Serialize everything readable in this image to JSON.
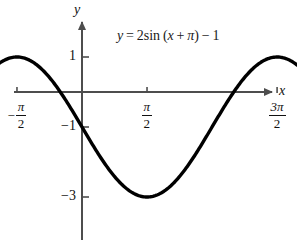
{
  "figure": {
    "background": "#ffffff",
    "curve_color": "#000000",
    "axis_color": "#4d4d4d",
    "text_color": "#111111"
  },
  "annotation": {
    "equation_text": "y = 2 sin (x + π) − 1",
    "lhs": "y",
    "equals": "=",
    "amplitude": "2",
    "function": "sin",
    "open_paren": "(",
    "variable": "x",
    "plus": "+",
    "phase": "π",
    "close_paren": ")",
    "minus": "−",
    "offset": "1"
  },
  "axes": {
    "x_name": "x",
    "y_name": "y",
    "x_ticks": [
      {
        "label": "−π/2",
        "sign": "−",
        "numerator": "π",
        "denominator": "2",
        "value": -1.5707963
      },
      {
        "label": "π/2",
        "sign": "",
        "numerator": "π",
        "denominator": "2",
        "value": 1.5707963
      },
      {
        "label": "3π/2",
        "sign": "",
        "numerator": "3π",
        "denominator": "2",
        "value": 4.712389
      },
      {
        "label": "5π/2",
        "sign": "",
        "numerator": "5π",
        "denominator": "2",
        "value": 7.8539816
      }
    ],
    "y_ticks": [
      {
        "label": "1",
        "value": 1
      },
      {
        "label": "−1",
        "value": -1
      },
      {
        "label": "−3",
        "value": -3
      }
    ]
  },
  "chart_data": {
    "type": "line",
    "xlabel": "x",
    "ylabel": "y",
    "function": "y = 2*sin(x + pi) - 1",
    "amplitude": 2,
    "period": 6.2831853,
    "phase_shift": -3.1415927,
    "vertical_shift": -1,
    "xlim": [
      -2.6179939,
      9.424778
    ],
    "ylim": [
      -3.6,
      1.6
    ],
    "grid": false,
    "legend": null,
    "x_tick_values": [
      -1.5707963,
      1.5707963,
      4.712389,
      7.8539816
    ],
    "x_tick_labels": [
      "−π/2",
      "π/2",
      "3π/2",
      "5π/2"
    ],
    "y_tick_values": [
      1,
      -1,
      -3
    ],
    "y_tick_labels": [
      "1",
      "−1",
      "−3"
    ],
    "maxima": [
      {
        "x": -1.5707963,
        "y": 1
      },
      {
        "x": 4.712389,
        "y": 1
      }
    ],
    "minima": [
      {
        "x": 1.5707963,
        "y": -3
      },
      {
        "x": 7.8539816,
        "y": -3
      }
    ],
    "x_intercepts": [
      -2.0943951,
      -1.0471976,
      4.1887902,
      5.2359878
    ],
    "y_intercept": -1,
    "samples_x": [
      -2.6179939,
      -2.3561945,
      -2.0943951,
      -1.8325957,
      -1.5707963,
      -1.3089969,
      -1.0471976,
      -0.7853982,
      -0.5235988,
      -0.2617994,
      0,
      0.2617994,
      0.5235988,
      0.7853982,
      1.0471976,
      1.3089969,
      1.5707963,
      1.8325957,
      2.0943951,
      2.3561945,
      2.6179939,
      2.8797933,
      3.1415927,
      3.4033921,
      3.6651914,
      3.9269908,
      4.1887902,
      4.4505896,
      4.712389,
      4.9741884,
      5.2359878,
      5.4977871,
      5.7595865,
      6.0213859,
      6.2831853,
      6.5449847,
      6.8067841,
      7.0685835,
      7.3303829,
      7.5921822,
      7.8539816,
      8.115781,
      8.3775804,
      8.6393798,
      8.9011792,
      9.1629786,
      9.424778
    ],
    "samples_y": [
      0.0,
      0.4142136,
      0.7320508,
      0.9318517,
      1.0,
      0.9318517,
      0.7320508,
      0.4142136,
      0.0,
      -0.4821224,
      -1.0,
      -1.5178776,
      -2.0,
      -2.4142136,
      -2.7320508,
      -2.9318517,
      -3.0,
      -2.9318517,
      -2.7320508,
      -2.4142136,
      -2.0,
      -1.5178776,
      -1.0,
      -0.4821224,
      0.0,
      0.4142136,
      0.7320508,
      0.9318517,
      1.0,
      0.9318517,
      0.7320508,
      0.4142136,
      0.0,
      -0.4821224,
      -1.0,
      -1.5178776,
      -2.0,
      -2.4142136,
      -2.7320508,
      -2.9318517,
      -3.0,
      -2.9318517,
      -2.7320508,
      -2.4142136,
      -2.0,
      -1.5178776,
      -1.0
    ]
  }
}
